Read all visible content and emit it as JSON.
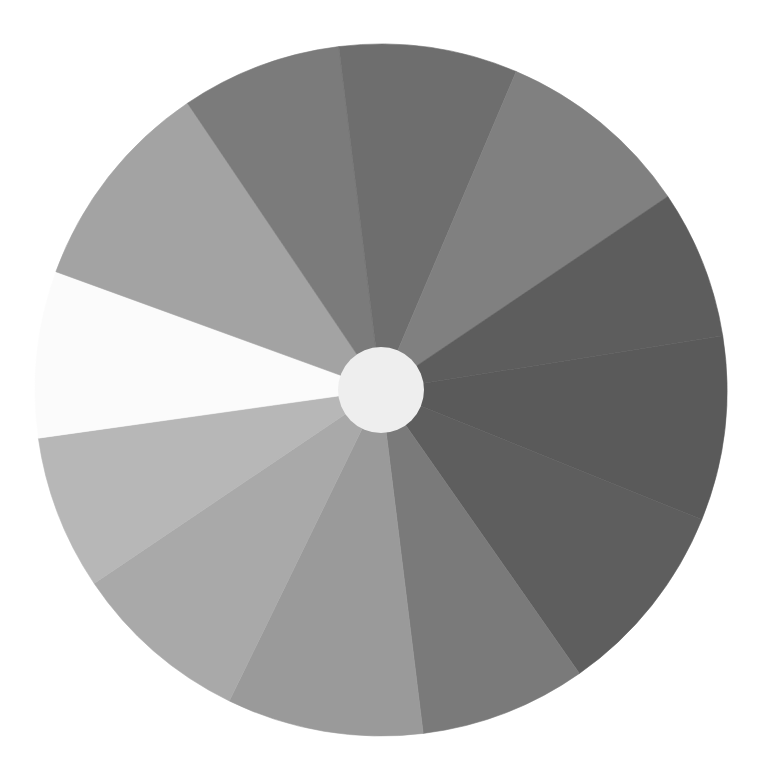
{
  "figure": {
    "type": "grayscale-color-wheel",
    "center": [
      381,
      390
    ],
    "outer_radius": 346,
    "hub_radius": 43,
    "hub_color": "#eeeeee",
    "background": "#ffffff",
    "segments": [
      {
        "id": "seg-1",
        "start_deg": -9,
        "end_deg": 22,
        "color": "#5a5a5a"
      },
      {
        "id": "seg-2",
        "start_deg": 22,
        "end_deg": 55,
        "color": "#5e5e5e"
      },
      {
        "id": "seg-3",
        "start_deg": 55,
        "end_deg": 83,
        "color": "#7a7a7a"
      },
      {
        "id": "seg-4",
        "start_deg": 83,
        "end_deg": 116,
        "color": "#9a9a9a"
      },
      {
        "id": "seg-5",
        "start_deg": 116,
        "end_deg": 146,
        "color": "#a9a9a9"
      },
      {
        "id": "seg-6",
        "start_deg": 146,
        "end_deg": 172,
        "color": "#b7b7b7"
      },
      {
        "id": "seg-7",
        "start_deg": 172,
        "end_deg": 200,
        "color": "#fbfbfb"
      },
      {
        "id": "seg-8",
        "start_deg": 200,
        "end_deg": 236,
        "color": "#a3a3a3"
      },
      {
        "id": "seg-9",
        "start_deg": 236,
        "end_deg": 263,
        "color": "#7b7b7b"
      },
      {
        "id": "seg-10",
        "start_deg": 263,
        "end_deg": 293,
        "color": "#6e6e6e"
      },
      {
        "id": "seg-11",
        "start_deg": 293,
        "end_deg": 326,
        "color": "#808080"
      },
      {
        "id": "seg-12",
        "start_deg": 326,
        "end_deg": 351,
        "color": "#5d5d5d"
      }
    ]
  }
}
